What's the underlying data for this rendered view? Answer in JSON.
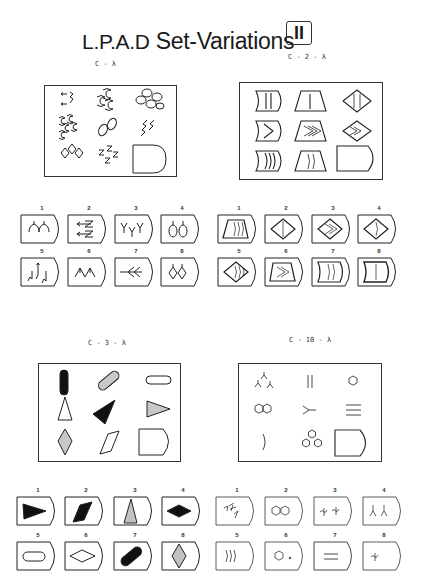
{
  "page": {
    "title_prefix": "L.P.A.D",
    "title_suffix": " Set-Variations",
    "set_number": "II"
  },
  "problems": [
    {
      "code": "C - λ",
      "cells": [
        "arrows-and-zigzags",
        "cat-head-shapes-three",
        "ovals-five",
        "cat-head-shapes-five",
        "ovals-two",
        "zigzag-arrows-three",
        "diamonds-three",
        "zigzag-arrows-five",
        "answer-slot"
      ],
      "answers": [
        {
          "number": "1",
          "figure": "cat-heads-two"
        },
        {
          "number": "2",
          "figure": "arrows-zigzag-two"
        },
        {
          "number": "3",
          "figure": "forks-three"
        },
        {
          "number": "4",
          "figure": "ovals-two-with-arrows"
        },
        {
          "number": "5",
          "figure": "zigzag-arrows-three"
        },
        {
          "number": "6",
          "figure": "arrowheads-two"
        },
        {
          "number": "7",
          "figure": "feathered-arrows"
        },
        {
          "number": "8",
          "figure": "diamonds-two"
        }
      ]
    },
    {
      "code": "C - 2 - λ",
      "cells": [
        "concave-rect-two-lines",
        "trapezoid-one-line",
        "diamond-two-lines",
        "concave-rect-chevron-one",
        "trapezoid-chevron-three",
        "diamond-chevron-two",
        "concave-rect-arcs-three",
        "trapezoid-arcs-two",
        "answer-slot"
      ],
      "answers": [
        {
          "number": "1",
          "figure": "trapezoid-arcs-three"
        },
        {
          "number": "2",
          "figure": "diamond-one-line"
        },
        {
          "number": "3",
          "figure": "diamond-chevron-two"
        },
        {
          "number": "4",
          "figure": "diamond-arc-one"
        },
        {
          "number": "5",
          "figure": "diamond-arcs-three"
        },
        {
          "number": "6",
          "figure": "trapezoid-chevron-two"
        },
        {
          "number": "7",
          "figure": "concave-rect-arcs-two"
        },
        {
          "number": "8",
          "figure": "concave-rect-one-line"
        }
      ]
    },
    {
      "code": "C - 3 - λ",
      "cells": [
        "pill-black-vertical",
        "pill-striped-diagonal",
        "pill-white-horizontal",
        "triangle-white-up",
        "triangle-black-diagonal",
        "triangle-striped-right",
        "diamond-striped-vertical",
        "parallelogram-white",
        "answer-slot"
      ],
      "answers": [
        {
          "number": "1",
          "figure": "triangle-black-right"
        },
        {
          "number": "2",
          "figure": "parallelogram-black"
        },
        {
          "number": "3",
          "figure": "triangle-striped-up"
        },
        {
          "number": "4",
          "figure": "diamond-black-horizontal"
        },
        {
          "number": "5",
          "figure": "pill-white-horizontal"
        },
        {
          "number": "6",
          "figure": "diamond-white-horizontal"
        },
        {
          "number": "7",
          "figure": "pill-black-diagonal"
        },
        {
          "number": "8",
          "figure": "diamond-striped-vertical"
        }
      ]
    },
    {
      "code": "C - 10 - λ",
      "cells": [
        "y-forks-three",
        "double-vertical-lines",
        "hexagon-one",
        "hexagons-two",
        "y-fork-sideways",
        "triple-horizontal-lines",
        "arc-one",
        "hexagons-three",
        "answer-slot"
      ],
      "answers": [
        {
          "number": "1",
          "figure": "twigs-three"
        },
        {
          "number": "2",
          "figure": "hexagons-two"
        },
        {
          "number": "3",
          "figure": "squiggles-two"
        },
        {
          "number": "4",
          "figure": "y-forks-two"
        },
        {
          "number": "5",
          "figure": "arcs-three"
        },
        {
          "number": "6",
          "figure": "hexagon-with-dot"
        },
        {
          "number": "7",
          "figure": "double-horizontal-lines"
        },
        {
          "number": "8",
          "figure": "squiggle-one"
        }
      ]
    }
  ]
}
